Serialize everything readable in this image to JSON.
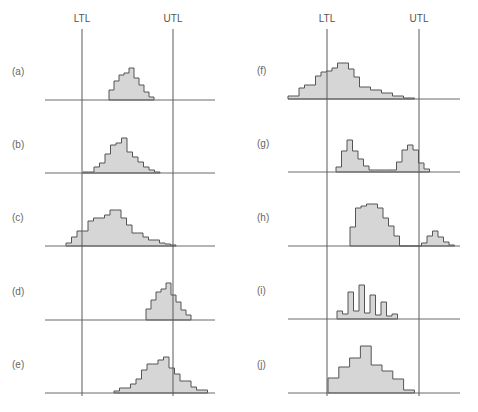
{
  "figure": {
    "colors": {
      "fill": "#d6d6d6",
      "outline": "#555555",
      "axis": "#6a6a6a"
    },
    "panels": [
      {
        "id": "left",
        "ltl_label": "LTL",
        "utl_label": "UTL",
        "ltl_x": 82,
        "utl_x": 173,
        "axis_x1": 45,
        "axis_x2": 215,
        "label_x": 12,
        "cases": [
          {
            "label": "(a)",
            "baseline": 100,
            "x0": 109,
            "w": 5,
            "heights": [
              10,
              19,
              25,
              27,
              32,
              22,
              15,
              8,
              3
            ]
          },
          {
            "label": "(b)",
            "baseline": 173,
            "x0": 83,
            "w": 5.5,
            "heights": [
              1,
              1,
              6,
              10,
              19,
              28,
              30,
              35,
              21,
              16,
              11,
              6,
              3,
              1
            ]
          },
          {
            "label": "(c)",
            "baseline": 246,
            "x0": 66,
            "w": 5.5,
            "heights": [
              3,
              9,
              15,
              15,
              25,
              28,
              28,
              31,
              36,
              36,
              28,
              21,
              13,
              13,
              9,
              6,
              6,
              3,
              2,
              1
            ]
          },
          {
            "label": "(d)",
            "baseline": 320,
            "x0": 146,
            "w": 5,
            "heights": [
              11,
              20,
              28,
              31,
              37,
              25,
              18,
              10,
              5
            ]
          },
          {
            "label": "(e)",
            "baseline": 393,
            "x0": 114,
            "w": 5.5,
            "heights": [
              2,
              5,
              5,
              9,
              14,
              23,
              29,
              29,
              33,
              36,
              25,
              19,
              12,
              12,
              6,
              3,
              3
            ]
          }
        ]
      },
      {
        "id": "right",
        "ltl_label": "LTL",
        "utl_label": "UTL",
        "ltl_x": 327,
        "utl_x": 419,
        "axis_x1": 288,
        "axis_x2": 460,
        "label_x": 257,
        "cases": [
          {
            "label": "(f)",
            "baseline": 99,
            "x0": 288,
            "w": 5.5,
            "heights": [
              3,
              3,
              11,
              14,
              14,
              23,
              27,
              28,
              31,
              36,
              36,
              30,
              22,
              12,
              12,
              9,
              9,
              6,
              6,
              3,
              3,
              1,
              1
            ]
          },
          {
            "label": "(g)",
            "baseline": 172,
            "x0": 336,
            "w": 5.5,
            "heights": [
              5,
              21,
              32,
              21,
              13,
              6,
              2,
              2,
              2,
              2,
              2,
              10,
              22,
              27,
              22,
              9,
              3
            ]
          },
          {
            "label": "(h)",
            "baseline": 246,
            "x0": 350,
            "w": 5.5,
            "heights": [
              19,
              38,
              40,
              42,
              42,
              38,
              28,
              20,
              10,
              0,
              0,
              0,
              0,
              3,
              10,
              15,
              9,
              4,
              1
            ]
          },
          {
            "label": "(i)",
            "baseline": 319,
            "x0": 337,
            "w": 5.5,
            "heights": [
              8,
              5,
              27,
              8,
              34,
              6,
              24,
              4,
              17,
              3,
              5
            ]
          },
          {
            "label": "(j)",
            "baseline": 393,
            "x0": 328,
            "w": 10.8,
            "heights": [
              15,
              26,
              35,
              47,
              28,
              22,
              14,
              3
            ]
          }
        ]
      }
    ]
  },
  "chart_data": {
    "type": "bar",
    "xlabel": "",
    "ylabel": "",
    "grid": false,
    "legend": [],
    "annotations": [
      "LTL",
      "UTL"
    ],
    "series": [
      {
        "name": "(a)",
        "values": [
          10,
          19,
          25,
          27,
          32,
          22,
          15,
          8,
          3
        ],
        "note": "narrow, centered inside limits"
      },
      {
        "name": "(b)",
        "values": [
          1,
          1,
          6,
          10,
          19,
          28,
          30,
          35,
          21,
          16,
          11,
          6,
          3,
          1
        ],
        "note": "fills tolerance exactly"
      },
      {
        "name": "(c)",
        "values": [
          3,
          9,
          15,
          15,
          25,
          28,
          28,
          31,
          36,
          36,
          28,
          21,
          13,
          13,
          9,
          6,
          6,
          3,
          2,
          1
        ],
        "note": "wider than tolerance, tails outside both limits"
      },
      {
        "name": "(d)",
        "values": [
          11,
          20,
          28,
          31,
          37,
          25,
          18,
          10,
          5
        ],
        "note": "shifted right, crossing UTL"
      },
      {
        "name": "(e)",
        "values": [
          2,
          5,
          5,
          9,
          14,
          23,
          29,
          29,
          33,
          36,
          25,
          19,
          12,
          12,
          6,
          3,
          3
        ],
        "note": "skewed, crossing UTL"
      },
      {
        "name": "(f)",
        "values": [
          3,
          3,
          11,
          14,
          14,
          23,
          27,
          28,
          31,
          36,
          36,
          30,
          22,
          12,
          12,
          9,
          9,
          6,
          6,
          3,
          3,
          1,
          1
        ],
        "note": "shifted left, crossing LTL"
      },
      {
        "name": "(g)",
        "values": [
          5,
          21,
          32,
          21,
          13,
          6,
          2,
          2,
          2,
          2,
          2,
          10,
          22,
          27,
          22,
          9,
          3
        ],
        "note": "bimodal"
      },
      {
        "name": "(h)",
        "values": [
          19,
          38,
          40,
          42,
          42,
          38,
          28,
          20,
          10,
          0,
          0,
          0,
          0,
          3,
          10,
          15,
          9,
          4,
          1
        ],
        "note": "main distribution plus isolated island beyond UTL"
      },
      {
        "name": "(i)",
        "values": [
          8,
          5,
          27,
          8,
          34,
          6,
          24,
          4,
          17,
          3,
          5
        ],
        "note": "comb / alternating pattern"
      },
      {
        "name": "(j)",
        "values": [
          15,
          26,
          35,
          47,
          28,
          22,
          14,
          3
        ],
        "note": "truncated at both limits (cliff edges)"
      }
    ]
  }
}
